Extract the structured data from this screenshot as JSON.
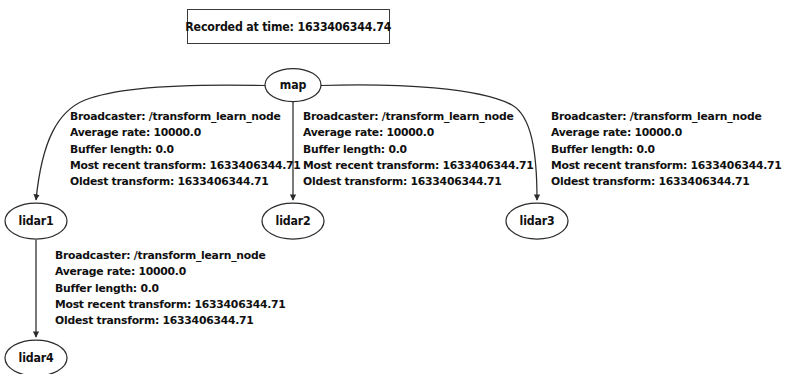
{
  "title": {
    "text": "Recorded at time: 1633406344.74"
  },
  "colors": {
    "background": "#ffffff",
    "stroke": "#2b2b2b",
    "text": "#101010"
  },
  "nodes": [
    {
      "id": "map",
      "label": "map"
    },
    {
      "id": "lidar1",
      "label": "lidar1"
    },
    {
      "id": "lidar2",
      "label": "lidar2"
    },
    {
      "id": "lidar3",
      "label": "lidar3"
    },
    {
      "id": "lidar4",
      "label": "lidar4"
    }
  ],
  "edges": [
    {
      "from": "map",
      "to": "lidar1",
      "label": {
        "broadcaster": "Broadcaster: /transform_learn_node",
        "average_rate": "Average rate: 10000.0",
        "buffer_length": "Buffer length: 0.0",
        "most_recent_transform": "Most recent transform: 1633406344.71",
        "oldest_transform": "Oldest transform: 1633406344.71"
      }
    },
    {
      "from": "map",
      "to": "lidar2",
      "label": {
        "broadcaster": "Broadcaster: /transform_learn_node",
        "average_rate": "Average rate: 10000.0",
        "buffer_length": "Buffer length: 0.0",
        "most_recent_transform": "Most recent transform: 1633406344.71",
        "oldest_transform": "Oldest transform: 1633406344.71"
      }
    },
    {
      "from": "map",
      "to": "lidar3",
      "label": {
        "broadcaster": "Broadcaster: /transform_learn_node",
        "average_rate": "Average rate: 10000.0",
        "buffer_length": "Buffer length: 0.0",
        "most_recent_transform": "Most recent transform: 1633406344.71",
        "oldest_transform": "Oldest transform: 1633406344.71"
      }
    },
    {
      "from": "lidar1",
      "to": "lidar4",
      "label": {
        "broadcaster": "Broadcaster: /transform_learn_node",
        "average_rate": "Average rate: 10000.0",
        "buffer_length": "Buffer length: 0.0",
        "most_recent_transform": "Most recent transform: 1633406344.71",
        "oldest_transform": "Oldest transform: 1633406344.71"
      }
    }
  ]
}
